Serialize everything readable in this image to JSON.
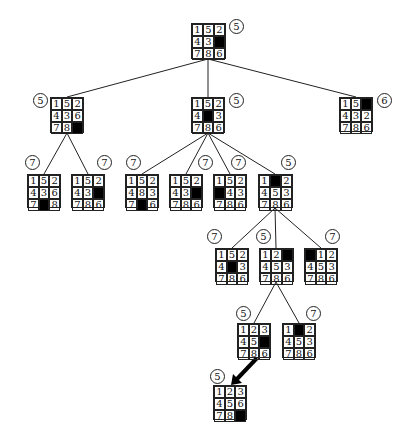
{
  "diagram": {
    "type": "8-puzzle search tree",
    "nodes": [
      {
        "id": "n0",
        "x": 191,
        "y": 23,
        "w": 35,
        "h": 36,
        "cost": "5",
        "cx": 236,
        "cy": 26,
        "tiles": [
          "1",
          "5",
          "2",
          "4",
          "3",
          "",
          "7",
          "8",
          "6"
        ]
      },
      {
        "id": "n1",
        "x": 50,
        "y": 97,
        "w": 34,
        "h": 36,
        "cost": "5",
        "cx": 40,
        "cy": 100,
        "tiles": [
          "1",
          "5",
          "2",
          "4",
          "3",
          "6",
          "7",
          "8",
          ""
        ]
      },
      {
        "id": "n2",
        "x": 191,
        "y": 97,
        "w": 34,
        "h": 36,
        "cost": "5",
        "cx": 236,
        "cy": 100,
        "tiles": [
          "1",
          "5",
          "2",
          "4",
          "",
          "3",
          "7",
          "8",
          "6"
        ]
      },
      {
        "id": "n3",
        "x": 339,
        "y": 97,
        "w": 34,
        "h": 35,
        "cost": "6",
        "cx": 384,
        "cy": 100,
        "tiles": [
          "1",
          "5",
          "",
          "4",
          "3",
          "2",
          "7",
          "8",
          "6"
        ]
      },
      {
        "id": "n4",
        "x": 27,
        "y": 174,
        "w": 34,
        "h": 34,
        "cost": "7",
        "cx": 32,
        "cy": 162,
        "tiles": [
          "1",
          "5",
          "2",
          "4",
          "3",
          "6",
          "7",
          "",
          "8"
        ]
      },
      {
        "id": "n5",
        "x": 71,
        "y": 174,
        "w": 34,
        "h": 34,
        "cost": "7",
        "cx": 104,
        "cy": 162,
        "tiles": [
          "1",
          "5",
          "2",
          "4",
          "3",
          "",
          "7",
          "8",
          "6"
        ]
      },
      {
        "id": "n6",
        "x": 125,
        "y": 174,
        "w": 34,
        "h": 34,
        "cost": "7",
        "cx": 133,
        "cy": 162,
        "tiles": [
          "1",
          "5",
          "2",
          "4",
          "8",
          "3",
          "7",
          "",
          "6"
        ]
      },
      {
        "id": "n7",
        "x": 169,
        "y": 174,
        "w": 34,
        "h": 34,
        "cost": "7",
        "cx": 205,
        "cy": 162,
        "tiles": [
          "1",
          "5",
          "2",
          "4",
          "3",
          "",
          "7",
          "8",
          "6"
        ]
      },
      {
        "id": "n8",
        "x": 213,
        "y": 174,
        "w": 34,
        "h": 34,
        "cost": "7",
        "cx": 238,
        "cy": 162,
        "tiles": [
          "1",
          "5",
          "2",
          "",
          "4",
          "3",
          "7",
          "8",
          "6"
        ]
      },
      {
        "id": "n9",
        "x": 258,
        "y": 174,
        "w": 35,
        "h": 34,
        "cost": "5",
        "cx": 288,
        "cy": 162,
        "tiles": [
          "1",
          "",
          "2",
          "4",
          "5",
          "3",
          "7",
          "8",
          "6"
        ]
      },
      {
        "id": "n10",
        "x": 215,
        "y": 248,
        "w": 34,
        "h": 34,
        "cost": "7",
        "cx": 214,
        "cy": 236,
        "tiles": [
          "1",
          "5",
          "2",
          "4",
          "",
          "3",
          "7",
          "8",
          "6"
        ]
      },
      {
        "id": "n11",
        "x": 259,
        "y": 248,
        "w": 35,
        "h": 34,
        "cost": "5",
        "cx": 263,
        "cy": 236,
        "tiles": [
          "1",
          "2",
          "",
          "4",
          "5",
          "3",
          "7",
          "8",
          "6"
        ]
      },
      {
        "id": "n12",
        "x": 304,
        "y": 248,
        "w": 34,
        "h": 34,
        "cost": "7",
        "cx": 332,
        "cy": 236,
        "tiles": [
          "",
          "1",
          "2",
          "4",
          "5",
          "3",
          "7",
          "8",
          "6"
        ]
      },
      {
        "id": "n13",
        "x": 237,
        "y": 323,
        "w": 34,
        "h": 35,
        "cost": "5",
        "cx": 243,
        "cy": 313,
        "tiles": [
          "1",
          "2",
          "3",
          "4",
          "5",
          "",
          "7",
          "8",
          "6"
        ]
      },
      {
        "id": "n14",
        "x": 282,
        "y": 323,
        "w": 34,
        "h": 35,
        "cost": "7",
        "cx": 313,
        "cy": 313,
        "tiles": [
          "1",
          "",
          "2",
          "4",
          "5",
          "3",
          "7",
          "8",
          "6"
        ]
      },
      {
        "id": "n15",
        "x": 213,
        "y": 385,
        "w": 34,
        "h": 35,
        "cost": "5",
        "cx": 217,
        "cy": 376,
        "tiles": [
          "1",
          "2",
          "3",
          "4",
          "5",
          "6",
          "7",
          "8",
          ""
        ]
      }
    ],
    "edges": [
      {
        "from": [
          208,
          59
        ],
        "to": [
          67,
          97
        ]
      },
      {
        "from": [
          208,
          59
        ],
        "to": [
          208,
          97
        ]
      },
      {
        "from": [
          208,
          59
        ],
        "to": [
          356,
          97
        ]
      },
      {
        "from": [
          67,
          133
        ],
        "to": [
          44,
          174
        ]
      },
      {
        "from": [
          67,
          133
        ],
        "to": [
          88,
          174
        ]
      },
      {
        "from": [
          208,
          133
        ],
        "to": [
          142,
          174
        ]
      },
      {
        "from": [
          208,
          133
        ],
        "to": [
          186,
          174
        ]
      },
      {
        "from": [
          208,
          133
        ],
        "to": [
          230,
          174
        ]
      },
      {
        "from": [
          208,
          133
        ],
        "to": [
          275,
          174
        ]
      },
      {
        "from": [
          275,
          208
        ],
        "to": [
          232,
          248
        ]
      },
      {
        "from": [
          275,
          208
        ],
        "to": [
          276,
          248
        ]
      },
      {
        "from": [
          275,
          208
        ],
        "to": [
          321,
          248
        ]
      },
      {
        "from": [
          276,
          282
        ],
        "to": [
          254,
          323
        ]
      },
      {
        "from": [
          276,
          282
        ],
        "to": [
          299,
          323
        ]
      }
    ],
    "solution_arrow": {
      "from": [
        257,
        358
      ],
      "to": [
        231,
        385
      ]
    },
    "colors": {
      "line": "#222222",
      "blank_tile": "#000000",
      "background": "#ffffff"
    }
  }
}
